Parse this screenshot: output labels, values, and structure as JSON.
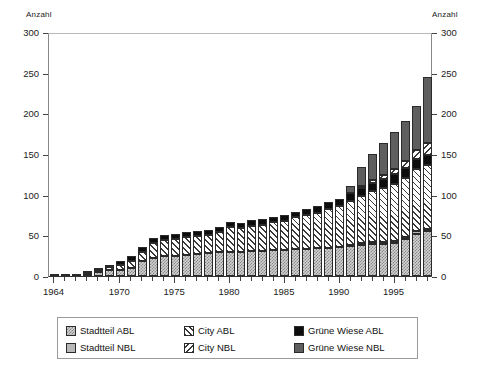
{
  "chart": {
    "y_axis_left_title": "Anzahl",
    "y_axis_right_title": "Anzahl"
  },
  "legend": {
    "rows": [
      [
        {
          "label": "Stadtteil ABL",
          "pattern": "p-stadtteil-abl",
          "name": "legend-swatch-stadtteil-abl"
        },
        {
          "label": "City ABL",
          "pattern": "p-city-abl",
          "name": "legend-swatch-city-abl"
        },
        {
          "label": "Grüne Wiese ABL",
          "pattern": "p-gruene-abl",
          "name": "legend-swatch-gruene-wiese-abl"
        }
      ],
      [
        {
          "label": "Stadtteil NBL",
          "pattern": "p-stadtteil-nbl",
          "name": "legend-swatch-stadtteil-nbl"
        },
        {
          "label": "City NBL",
          "pattern": "p-city-nbl",
          "name": "legend-swatch-city-nbl"
        },
        {
          "label": "Grüne Wiese NBL",
          "pattern": "p-gruene-nbl",
          "name": "legend-swatch-gruene-wiese-nbl"
        }
      ]
    ]
  },
  "chart_data": {
    "type": "bar",
    "stacked": true,
    "title": "",
    "subtitle": "",
    "xlabel": "",
    "ylabel": "Anzahl",
    "ylabel_right": "Anzahl",
    "ylim": [
      0,
      300
    ],
    "yticks": [
      0,
      50,
      100,
      150,
      200,
      250,
      300
    ],
    "grid": false,
    "legend_position": "bottom",
    "x": [
      1964,
      1965,
      1966,
      1967,
      1968,
      1969,
      1970,
      1971,
      1972,
      1973,
      1974,
      1975,
      1976,
      1977,
      1978,
      1979,
      1980,
      1981,
      1982,
      1983,
      1984,
      1985,
      1986,
      1987,
      1988,
      1989,
      1990,
      1991,
      1992,
      1993,
      1994,
      1995,
      1996,
      1997,
      1998
    ],
    "xticks": [
      1964,
      1970,
      1975,
      1980,
      1985,
      1990,
      1995
    ],
    "xticklabels": [
      "1964",
      "1970",
      "1975",
      "1980",
      "1985",
      "1990",
      "1995"
    ],
    "series": [
      {
        "name": "Stadtteil ABL",
        "pattern": "p-stadtteil-abl",
        "values": [
          1,
          1,
          2,
          3,
          5,
          7,
          8,
          10,
          18,
          22,
          24,
          25,
          26,
          27,
          28,
          29,
          30,
          30,
          31,
          31,
          32,
          32,
          33,
          33,
          34,
          35,
          36,
          37,
          38,
          39,
          39,
          40,
          45,
          52,
          55
        ]
      },
      {
        "name": "Stadtteil NBL",
        "pattern": "p-stadtteil-nbl",
        "values": [
          0,
          0,
          0,
          0,
          0,
          0,
          0,
          0,
          0,
          0,
          0,
          0,
          0,
          0,
          0,
          0,
          0,
          0,
          0,
          0,
          0,
          0,
          0,
          0,
          0,
          0,
          0,
          1,
          2,
          3,
          3,
          3,
          3,
          3,
          3
        ]
      },
      {
        "name": "City ABL",
        "pattern": "p-city-abl",
        "values": [
          0,
          0,
          0,
          1,
          2,
          4,
          6,
          9,
          12,
          19,
          20,
          21,
          22,
          22,
          23,
          25,
          30,
          29,
          31,
          32,
          34,
          36,
          39,
          42,
          44,
          47,
          50,
          54,
          58,
          62,
          66,
          70,
          72,
          76,
          78
        ]
      },
      {
        "name": "Grüne Wiese ABL",
        "pattern": "p-gruene-abl",
        "values": [
          0,
          0,
          0,
          1,
          2,
          3,
          4,
          5,
          6,
          6,
          6,
          6,
          6,
          6,
          6,
          6,
          6,
          6,
          7,
          7,
          7,
          7,
          7,
          8,
          8,
          9,
          9,
          10,
          10,
          10,
          11,
          12,
          13,
          13,
          13
        ]
      },
      {
        "name": "City NBL",
        "pattern": "p-city-nbl",
        "values": [
          0,
          0,
          0,
          0,
          0,
          0,
          0,
          0,
          0,
          0,
          0,
          0,
          0,
          0,
          0,
          0,
          0,
          0,
          0,
          0,
          0,
          0,
          0,
          0,
          0,
          0,
          0,
          0,
          3,
          4,
          5,
          7,
          9,
          11,
          14
        ]
      },
      {
        "name": "Grüne Wiese NBL",
        "pattern": "p-gruene-nbl",
        "values": [
          0,
          0,
          0,
          0,
          0,
          0,
          0,
          0,
          0,
          0,
          0,
          0,
          0,
          0,
          0,
          0,
          0,
          0,
          0,
          0,
          0,
          0,
          0,
          0,
          0,
          0,
          0,
          9,
          23,
          32,
          40,
          45,
          49,
          54,
          82
        ]
      }
    ],
    "totals": [
      1,
      1,
      2,
      5,
      9,
      14,
      18,
      24,
      36,
      47,
      50,
      52,
      54,
      55,
      57,
      60,
      66,
      65,
      69,
      70,
      73,
      75,
      79,
      83,
      86,
      91,
      95,
      111,
      134,
      150,
      164,
      177,
      191,
      209,
      245
    ]
  }
}
